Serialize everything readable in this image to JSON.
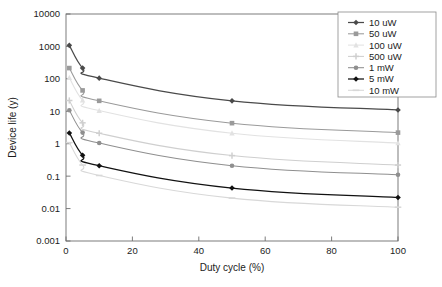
{
  "chart_data": {
    "type": "line",
    "title": "",
    "xlabel": "Duty cycle (%)",
    "ylabel": "Device life (y)",
    "xlim": [
      0,
      100
    ],
    "ylim": [
      0.001,
      10000
    ],
    "yscale": "log",
    "xscale": "linear",
    "grid": false,
    "legend_position": "top-right",
    "x": [
      1,
      5,
      10,
      50,
      100
    ],
    "xticks": [
      "0",
      "20",
      "40",
      "60",
      "80",
      "100"
    ],
    "xtick_values": [
      0,
      20,
      40,
      60,
      80,
      100
    ],
    "yticks": [
      "10000",
      "1000",
      "100",
      "10",
      "1",
      "0.1",
      "0.01",
      "0.001"
    ],
    "ytick_values": [
      10000,
      1000,
      100,
      10,
      1,
      0.1,
      0.01,
      0.001
    ],
    "series": [
      {
        "name": "10 uW",
        "color": "#4a4a4a",
        "marker": "diamond",
        "values": [
          1080,
          215,
          105,
          21,
          11
        ]
      },
      {
        "name": "50 uW",
        "color": "#9a9a9a",
        "marker": "square",
        "values": [
          215,
          44,
          21,
          4.3,
          2.2
        ]
      },
      {
        "name": "100 uW",
        "color": "#e2e2e2",
        "marker": "triangle",
        "values": [
          108,
          22,
          10.5,
          2.1,
          1.05
        ]
      },
      {
        "name": "500 uW",
        "color": "#cfcfcf",
        "marker": "cross",
        "values": [
          21.5,
          4.4,
          2.1,
          0.43,
          0.22
        ]
      },
      {
        "name": "1 mW",
        "color": "#8f8f8f",
        "marker": "circle",
        "values": [
          10.8,
          2.2,
          1.05,
          0.21,
          0.11
        ]
      },
      {
        "name": "5 mW",
        "color": "#111111",
        "marker": "diamond",
        "values": [
          2.15,
          0.44,
          0.21,
          0.043,
          0.022
        ]
      },
      {
        "name": "10 mW",
        "color": "#d8d8d8",
        "marker": "bar",
        "values": [
          1.08,
          0.22,
          0.105,
          0.021,
          0.011
        ]
      }
    ]
  },
  "axes": {
    "x_title": "Duty cycle (%)",
    "y_title": "Device life (y)"
  }
}
